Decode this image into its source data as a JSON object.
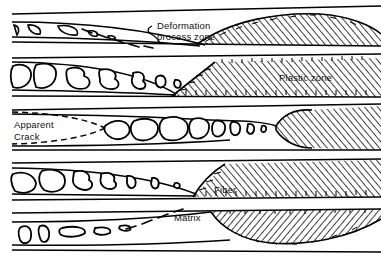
{
  "figure": {
    "background_color": "#ffffff",
    "line_color": "#000000",
    "hatch_color": "#000000",
    "width": 381,
    "height": 262
  },
  "labels": {
    "deformation_zone_line1": "Deformation",
    "deformation_zone_line2": "process zone",
    "plastic_zone": "Plastic zone",
    "apparent_crack_line1": "Apparent",
    "apparent_crack_line2": "Crack",
    "fiber": "Fiber",
    "matrix": "Matrix"
  },
  "bands": [
    {
      "index": 1,
      "name": "band-deformation-process-zone",
      "void_style": "angular-triangular",
      "void_count": 6,
      "hatch_shape": "dome-lens",
      "has_dashed_crack": true,
      "dashed_crack_style": "diagonal-dashes"
    },
    {
      "index": 2,
      "name": "band-plastic-zone",
      "void_style": "large-rounded-irregular",
      "void_count": 7,
      "hatch_shape": "wedge-diagonal-front",
      "has_dashed_crack": false
    },
    {
      "index": 3,
      "name": "band-apparent-crack",
      "void_style": "coalesced-jagged",
      "void_count": 8,
      "hatch_shape": "blunt-rounded-front",
      "has_dashed_crack": true,
      "dashed_crack_style": "parabolic-tip"
    },
    {
      "index": 4,
      "name": "band-fiber",
      "void_style": "rounded-blobs-tapering",
      "void_count": 7,
      "hatch_shape": "angled-front",
      "has_dashed_crack": false
    },
    {
      "index": 5,
      "name": "band-matrix",
      "void_style": "small-elongated",
      "void_count": 5,
      "hatch_shape": "inverted-dome-bowl",
      "has_dashed_crack": true,
      "dashed_crack_style": "rising-dashes"
    }
  ]
}
